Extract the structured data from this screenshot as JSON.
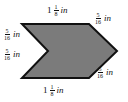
{
  "figure": {
    "background_color": "#ffffff",
    "shape": {
      "fill": "#7b7b7b",
      "stroke": "#111111",
      "stroke_width": "2",
      "points": "22,24 89,24 117,51 89,78 22,78 48,51"
    },
    "labels": {
      "top": {
        "whole": "1",
        "num": "1",
        "den": "8",
        "unit": "in"
      },
      "top_right": {
        "num": "5",
        "den": "16",
        "unit": "in"
      },
      "left_upper": {
        "num": "5",
        "den": "16",
        "unit": "in"
      },
      "left_lower": {
        "num": "5",
        "den": "16",
        "unit": "in"
      },
      "bottom_right": {
        "num": "5",
        "den": "16",
        "unit": "in"
      },
      "bottom": {
        "whole": "1",
        "num": "1",
        "den": "8",
        "unit": "in"
      }
    }
  }
}
